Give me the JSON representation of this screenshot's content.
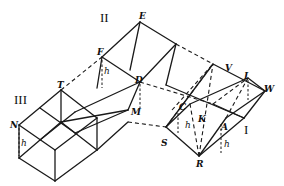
{
  "diagram": {
    "type": "geometric solid figure (prismoid decomposition)",
    "regions": [
      {
        "id": "I",
        "label": "I"
      },
      {
        "id": "II",
        "label": "II"
      },
      {
        "id": "III",
        "label": "III"
      }
    ],
    "points": {
      "E": "E",
      "F": "F",
      "T": "T",
      "D": "D",
      "M": "M",
      "N": "N",
      "V": "V",
      "I": "I",
      "W": "W",
      "C": "C",
      "K": "K",
      "A": "A",
      "S": "S",
      "R": "R"
    },
    "height_label": "h",
    "colors": {
      "ink": "#1a1a1a",
      "background": "#ffffff"
    }
  }
}
